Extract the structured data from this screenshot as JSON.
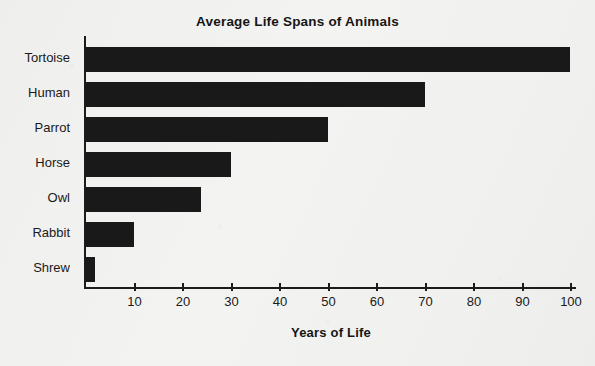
{
  "chart_data": {
    "type": "bar",
    "orientation": "horizontal",
    "title": "Average Life Spans of Animals",
    "xlabel": "Years of Life",
    "ylabel": "",
    "categories": [
      "Tortoise",
      "Human",
      "Parrot",
      "Horse",
      "Owl",
      "Rabbit",
      "Shrew"
    ],
    "values": [
      100,
      70,
      50,
      30,
      24,
      10,
      2
    ],
    "xlim": [
      0,
      100
    ],
    "xticks": [
      10,
      20,
      30,
      40,
      50,
      60,
      70,
      80,
      90,
      100
    ],
    "xtick_labels": [
      "10",
      "20",
      "30",
      "40",
      "50",
      "60",
      "70",
      "80",
      "90",
      "100"
    ],
    "grid": false,
    "legend": false,
    "bar_color": "#191919",
    "axis_color": "#1c1c1c",
    "background_color": "#f1f1ef",
    "text_color": "#1a1a1a"
  }
}
